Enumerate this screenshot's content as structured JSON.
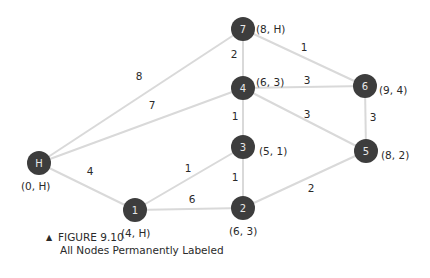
{
  "figure": {
    "number_label": "FIGURE 9.10",
    "title": "All Nodes Permanently Labeled",
    "marker": "▲"
  },
  "colors": {
    "node_fill": "#3d3d3d",
    "node_text": "#e8e8e8",
    "edge": "#d9d9d9",
    "text": "#2a2a2a"
  },
  "nodes": [
    {
      "id": "H",
      "x": 39,
      "y": 163,
      "label": "(0, H)",
      "lx": 21,
      "ly": 186
    },
    {
      "id": "1",
      "x": 135,
      "y": 210,
      "label": "(4, H)",
      "lx": 121,
      "ly": 233
    },
    {
      "id": "2",
      "x": 243,
      "y": 208,
      "label": "(6, 3)",
      "lx": 229,
      "ly": 231
    },
    {
      "id": "3",
      "x": 243,
      "y": 147,
      "label": "(5, 1)",
      "lx": 259,
      "ly": 151
    },
    {
      "id": "4",
      "x": 243,
      "y": 88,
      "label": "(6, 3)",
      "lx": 256,
      "ly": 82
    },
    {
      "id": "7",
      "x": 243,
      "y": 29,
      "label": "(8, H)",
      "lx": 256,
      "ly": 29
    },
    {
      "id": "6",
      "x": 365,
      "y": 86,
      "label": "(9, 4)",
      "lx": 379,
      "ly": 90
    },
    {
      "id": "5",
      "x": 366,
      "y": 151,
      "label": "(8, 2)",
      "lx": 381,
      "ly": 155
    }
  ],
  "edges": [
    {
      "from": "H",
      "to": "7",
      "weight": "8",
      "wx": 139,
      "wy": 76
    },
    {
      "from": "H",
      "to": "4",
      "weight": "7",
      "wx": 152,
      "wy": 105
    },
    {
      "from": "H",
      "to": "1",
      "weight": "4",
      "wx": 90,
      "wy": 171
    },
    {
      "from": "1",
      "to": "3",
      "weight": "1",
      "wx": 188,
      "wy": 168
    },
    {
      "from": "1",
      "to": "2",
      "weight": "6",
      "wx": 192,
      "wy": 199
    },
    {
      "from": "2",
      "to": "3",
      "weight": "1",
      "wx": 235,
      "wy": 177
    },
    {
      "from": "3",
      "to": "4",
      "weight": "1",
      "wx": 235,
      "wy": 116
    },
    {
      "from": "4",
      "to": "7",
      "weight": "2",
      "wx": 234,
      "wy": 54
    },
    {
      "from": "7",
      "to": "6",
      "weight": "1",
      "wx": 304,
      "wy": 47
    },
    {
      "from": "4",
      "to": "6",
      "weight": "3",
      "wx": 307,
      "wy": 80
    },
    {
      "from": "4",
      "to": "5",
      "weight": "3",
      "wx": 307,
      "wy": 114
    },
    {
      "from": "6",
      "to": "5",
      "weight": "3",
      "wx": 373,
      "wy": 117
    },
    {
      "from": "2",
      "to": "5",
      "weight": "2",
      "wx": 311,
      "wy": 188
    }
  ]
}
